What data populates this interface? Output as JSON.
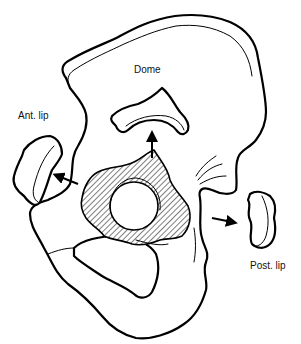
{
  "diagram": {
    "labels": {
      "dome": "Dome",
      "anterior_lip": "Ant. lip",
      "posterior_lip": "Post. lip"
    },
    "elements": [
      {
        "name": "pelvis-outline",
        "kind": "bone outline"
      },
      {
        "name": "acetabulum-center",
        "kind": "hatched articular region"
      },
      {
        "name": "femoral-head-socket",
        "kind": "circle"
      },
      {
        "name": "dome-fragment",
        "kind": "displaced fragment",
        "direction": "up"
      },
      {
        "name": "anterior-lip-fragment",
        "kind": "displaced fragment",
        "direction": "left"
      },
      {
        "name": "posterior-lip-fragment",
        "kind": "displaced fragment",
        "direction": "right"
      }
    ],
    "colors": {
      "stroke": "#000000",
      "background": "#ffffff",
      "hatch": "#000000"
    }
  }
}
